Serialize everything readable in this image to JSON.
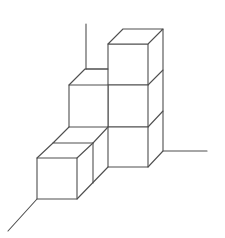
{
  "figure": {
    "width": 225,
    "height": 238,
    "background": "#ffffff",
    "stroke_color": "#4f4f4f",
    "stroke_width": 1.1,
    "cube_count": 6,
    "axes": [
      {
        "name": "vertical-axis",
        "points": [
          [
            86,
            24
          ],
          [
            86,
            69
          ]
        ]
      },
      {
        "name": "back-floor-axis",
        "points": [
          [
            86,
            69
          ],
          [
            108,
            69
          ]
        ]
      },
      {
        "name": "right-axis",
        "points": [
          [
            163,
            151
          ],
          [
            207,
            151
          ]
        ]
      },
      {
        "name": "front-diagonal-axis",
        "points": [
          [
            37,
            199
          ],
          [
            8,
            231
          ]
        ]
      }
    ],
    "edges": [
      {
        "name": "top-cube-front-face",
        "type": "polygon",
        "points": [
          [
            108,
            44
          ],
          [
            148,
            44
          ],
          [
            148,
            85
          ],
          [
            108,
            85
          ]
        ]
      },
      {
        "name": "top-cube-top-face",
        "type": "polygon",
        "points": [
          [
            108,
            44
          ],
          [
            123,
            29
          ],
          [
            163,
            29
          ],
          [
            148,
            44
          ]
        ]
      },
      {
        "name": "top-cube-right-face",
        "type": "polyline",
        "points": [
          [
            163,
            29
          ],
          [
            163,
            70
          ],
          [
            148,
            85
          ]
        ]
      },
      {
        "name": "middle-right-cube-front-face",
        "type": "polygon",
        "points": [
          [
            108,
            85
          ],
          [
            148,
            85
          ],
          [
            148,
            127
          ],
          [
            108,
            127
          ]
        ]
      },
      {
        "name": "middle-right-cube-right-face",
        "type": "polyline",
        "points": [
          [
            163,
            70
          ],
          [
            163,
            111
          ],
          [
            148,
            127
          ]
        ]
      },
      {
        "name": "middle-left-cube-front-face",
        "type": "polygon",
        "points": [
          [
            69,
            85
          ],
          [
            108,
            85
          ],
          [
            108,
            127
          ],
          [
            69,
            127
          ]
        ]
      },
      {
        "name": "middle-left-cube-top-face",
        "type": "polyline",
        "points": [
          [
            69,
            85
          ],
          [
            85,
            69
          ],
          [
            108,
            69
          ]
        ]
      },
      {
        "name": "bottom-right-cube-front-face",
        "type": "polygon",
        "points": [
          [
            108,
            127
          ],
          [
            148,
            127
          ],
          [
            148,
            167
          ],
          [
            108,
            167
          ]
        ]
      },
      {
        "name": "bottom-right-cube-right-face",
        "type": "polyline",
        "points": [
          [
            163,
            111
          ],
          [
            163,
            151
          ],
          [
            148,
            167
          ]
        ]
      },
      {
        "name": "inner-cube-top-face",
        "type": "polyline",
        "points": [
          [
            69,
            127
          ],
          [
            53,
            143
          ],
          [
            93,
            143
          ],
          [
            108,
            127
          ]
        ]
      },
      {
        "name": "inner-cube-right-edge",
        "type": "polyline",
        "points": [
          [
            93,
            143
          ],
          [
            93,
            183
          ]
        ]
      },
      {
        "name": "inner-cube-bottom-diagonal",
        "type": "polyline",
        "points": [
          [
            77,
            199
          ],
          [
            108,
            167
          ]
        ]
      },
      {
        "name": "front-cube-front-face",
        "type": "polygon",
        "points": [
          [
            37,
            158
          ],
          [
            77,
            158
          ],
          [
            77,
            199
          ],
          [
            37,
            199
          ]
        ]
      },
      {
        "name": "front-cube-top-left-diagonal",
        "type": "polyline",
        "points": [
          [
            37,
            158
          ],
          [
            53,
            143
          ]
        ]
      },
      {
        "name": "front-cube-top-right-diagonal",
        "type": "polyline",
        "points": [
          [
            77,
            158
          ],
          [
            93,
            143
          ]
        ]
      }
    ]
  }
}
